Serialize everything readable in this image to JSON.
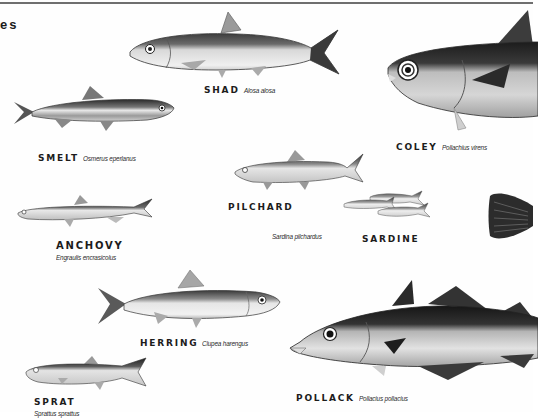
{
  "page": {
    "heading_fragment": "es",
    "colors": {
      "background": "#fefefe",
      "rule": "#6f6f6f",
      "ink": "#1c1c1c",
      "fish_dark": "#2b2b2b",
      "fish_mid": "#8a8a8a",
      "fish_light": "#e4e4e4"
    }
  },
  "fish": [
    {
      "id": "shad",
      "common": "SHAD",
      "latin": "Alosa alosa"
    },
    {
      "id": "smelt",
      "common": "SMELT",
      "latin": "Osmerus eperlanus"
    },
    {
      "id": "coley",
      "common": "COLEY",
      "latin": "Pollachius virens"
    },
    {
      "id": "pilchard",
      "common": "PILCHARD",
      "latin": "Sardina pilchardus"
    },
    {
      "id": "sardine",
      "common": "SARDINE",
      "latin": ""
    },
    {
      "id": "anchovy",
      "common": "ANCHOVY",
      "latin": "Engraulis encrasicolus"
    },
    {
      "id": "herring",
      "common": "HERRING",
      "latin": "Clupea harengus"
    },
    {
      "id": "sprat",
      "common": "SPRAT",
      "latin": "Sprattus sprattus"
    },
    {
      "id": "pollack",
      "common": "POLLACK",
      "latin": "Pollacius pollacius"
    }
  ]
}
